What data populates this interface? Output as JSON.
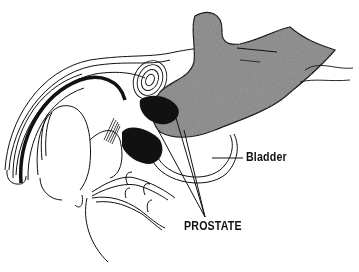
{
  "diagram": {
    "labels": {
      "bladder": "Bladder",
      "prostate": "PROSTATE"
    },
    "colors": {
      "line": "#111111",
      "stipple_fill": "#7a7a7a",
      "solid_fill": "#111111",
      "background": "#ffffff"
    }
  }
}
